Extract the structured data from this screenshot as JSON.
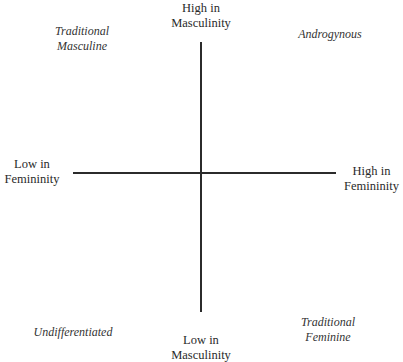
{
  "diagram": {
    "type": "two-axis quadrant diagram",
    "axes": {
      "vertical": {
        "top_label": [
          "High in",
          "Masculinity"
        ],
        "bottom_label": [
          "Low in",
          "Masculinity"
        ]
      },
      "horizontal": {
        "left_label": [
          "Low in",
          "Femininity"
        ],
        "right_label": [
          "High in",
          "Femininity"
        ]
      }
    },
    "quadrants": {
      "top_left": [
        "Traditional",
        "Masculine"
      ],
      "top_right": [
        "Androgynous"
      ],
      "bottom_left": [
        "Undifferentiated"
      ],
      "bottom_right": [
        "Traditional",
        "Feminine"
      ]
    },
    "colors": {
      "line": "#2b2b2b",
      "text": "#2a2a2a",
      "background": "#ffffff"
    }
  }
}
